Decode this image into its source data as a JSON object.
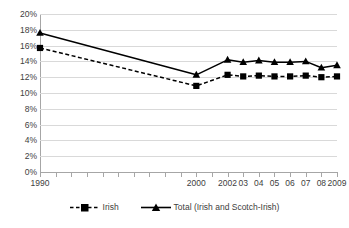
{
  "chart_data": {
    "type": "line",
    "title": "",
    "xlabel": "",
    "ylabel": "",
    "ylim": [
      0,
      20
    ],
    "grid": true,
    "legend_position": "bottom",
    "x": [
      1990,
      1991,
      1992,
      1993,
      1994,
      1995,
      1996,
      1997,
      1998,
      1999,
      2000,
      2001,
      2002,
      2003,
      2004,
      2005,
      2006,
      2007,
      2008,
      2009
    ],
    "tick_labels": [
      "1990",
      "",
      "",
      "",
      "",
      "",
      "",
      "",
      "",
      "",
      "2000",
      "",
      "2002",
      "03",
      "04",
      "05",
      "06",
      "07",
      "08",
      "2009"
    ],
    "y_tick_labels": [
      "0%",
      "2%",
      "4%",
      "6%",
      "8%",
      "10%",
      "12%",
      "14%",
      "16%",
      "18%",
      "20%"
    ],
    "y_tick_values": [
      0,
      2,
      4,
      6,
      8,
      10,
      12,
      14,
      16,
      18,
      20
    ],
    "series": [
      {
        "name": "Irish",
        "marker": "square",
        "line_style": "dashed",
        "color": "#000000",
        "values": [
          15.7,
          null,
          null,
          null,
          null,
          null,
          null,
          null,
          null,
          null,
          10.9,
          null,
          12.3,
          12.1,
          12.2,
          12.1,
          12.1,
          12.2,
          12.0,
          12.1
        ]
      },
      {
        "name": "Total (Irish and Scotch-Irish)",
        "marker": "triangle",
        "line_style": "solid",
        "color": "#000000",
        "values": [
          17.6,
          null,
          null,
          null,
          null,
          null,
          null,
          null,
          null,
          null,
          12.3,
          null,
          14.2,
          13.9,
          14.1,
          13.9,
          13.9,
          14.0,
          13.2,
          13.5
        ]
      }
    ]
  },
  "legend": {
    "items": [
      {
        "label": "Irish"
      },
      {
        "label": "Total (Irish and Scotch-Irish)"
      }
    ]
  }
}
